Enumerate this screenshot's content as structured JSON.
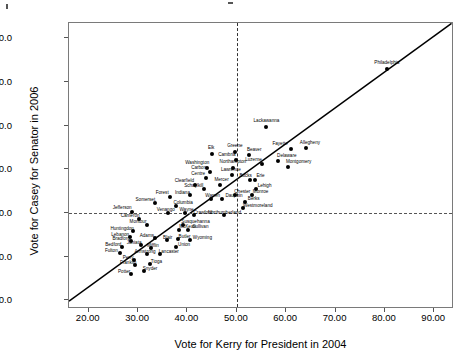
{
  "chart_data": {
    "type": "scatter",
    "title": "",
    "xlabel": "Vote for Kerry for President in 2004",
    "ylabel": "Vote for Casey for Senator in 2006",
    "xlim": [
      16.0,
      94.0
    ],
    "ylim": [
      28.0,
      93.5
    ],
    "xticks": [
      "20.00",
      "30.00",
      "40.00",
      "50.00",
      "60.00",
      "70.00",
      "80.00",
      "90.00"
    ],
    "xtick_values": [
      20,
      30,
      40,
      50,
      60,
      70,
      80,
      90
    ],
    "yticks": [
      "90.0",
      "80.0",
      "70.0",
      "60.0",
      "50.0",
      "40.0",
      "30.0"
    ],
    "ytick_values": [
      90,
      80,
      70,
      60,
      50,
      40,
      30
    ],
    "grid": false,
    "legend": null,
    "reference_lines": [
      {
        "axis": "x",
        "value": 50,
        "style": "dashed"
      },
      {
        "axis": "y",
        "value": 50,
        "style": "dashed"
      }
    ],
    "fit_line": {
      "style": "solid",
      "x0": 16.0,
      "y0": 29.8,
      "x1": 93.5,
      "y1": 93.4
    },
    "points": [
      {
        "label": "Philadelphia",
        "x": 80.4,
        "y": 83.0,
        "lx": 0,
        "ly": -6
      },
      {
        "label": "Lackawanna",
        "x": 56.0,
        "y": 69.7,
        "lx": 0,
        "ly": -6
      },
      {
        "label": "Fayette",
        "x": 61.0,
        "y": 64.7,
        "lx": -11,
        "ly": -5
      },
      {
        "label": "Allegheny",
        "x": 64.0,
        "y": 64.9,
        "lx": 4,
        "ly": -5
      },
      {
        "label": "Greene",
        "x": 49.6,
        "y": 63.9,
        "lx": 0,
        "ly": -6
      },
      {
        "label": "Elk",
        "x": 45.0,
        "y": 63.4,
        "lx": -1,
        "ly": -6
      },
      {
        "label": "Beaver",
        "x": 52.5,
        "y": 63.2,
        "lx": 5,
        "ly": -5
      },
      {
        "label": "Cambria",
        "x": 49.8,
        "y": 62.1,
        "lx": -9,
        "ly": -5
      },
      {
        "label": "Delaware",
        "x": 58.3,
        "y": 62.0,
        "lx": 9,
        "ly": -5
      },
      {
        "label": "Luzerne",
        "x": 55.0,
        "y": 61.3,
        "lx": -8,
        "ly": -4
      },
      {
        "label": "Montgomery",
        "x": 60.3,
        "y": 60.5,
        "lx": 11,
        "ly": -5
      },
      {
        "label": "Northampton",
        "x": 49.2,
        "y": 60.3,
        "lx": 0,
        "ly": -6
      },
      {
        "label": "Washington",
        "x": 44.0,
        "y": 60.4,
        "lx": -10,
        "ly": -5
      },
      {
        "label": "Carbon",
        "x": 44.5,
        "y": 59.3,
        "lx": -11,
        "ly": -4
      },
      {
        "label": "Lawrence",
        "x": 49.0,
        "y": 58.8,
        "lx": -1,
        "ly": -5
      },
      {
        "label": "Erie",
        "x": 53.6,
        "y": 57.6,
        "lx": 6,
        "ly": -4
      },
      {
        "label": "Bucks",
        "x": 52.6,
        "y": 57.6,
        "lx": -4,
        "ly": -4
      },
      {
        "label": "Centre",
        "x": 43.8,
        "y": 57.9,
        "lx": -8,
        "ly": -4
      },
      {
        "label": "Clearfield",
        "x": 41.6,
        "y": 56.5,
        "lx": -11,
        "ly": -4
      },
      {
        "label": "Mercer",
        "x": 46.5,
        "y": 56.3,
        "lx": 2,
        "ly": -5
      },
      {
        "label": "Schuylkill",
        "x": 43.3,
        "y": 55.4,
        "lx": -10,
        "ly": -3
      },
      {
        "label": "Lehigh",
        "x": 53.8,
        "y": 55.4,
        "lx": 9,
        "ly": -3
      },
      {
        "label": "Chester",
        "x": 49.7,
        "y": 54.0,
        "lx": 7,
        "ly": -3
      },
      {
        "label": "Monroe",
        "x": 53.0,
        "y": 54.0,
        "lx": 9,
        "ly": -3
      },
      {
        "label": "Indiana",
        "x": 40.6,
        "y": 54.2,
        "lx": -8,
        "ly": -2
      },
      {
        "label": "Warren",
        "x": 44.7,
        "y": 53.2,
        "lx": 2,
        "ly": -3
      },
      {
        "label": "Dauphin",
        "x": 47.0,
        "y": 53.2,
        "lx": 12,
        "ly": -3
      },
      {
        "label": "Berks",
        "x": 51.6,
        "y": 52.6,
        "lx": 9,
        "ly": -3
      },
      {
        "label": "Forest",
        "x": 36.5,
        "y": 53.6,
        "lx": -8,
        "ly": -4
      },
      {
        "label": "Somerset",
        "x": 33.5,
        "y": 52.3,
        "lx": -10,
        "ly": -3
      },
      {
        "label": "Columbia",
        "x": 37.7,
        "y": 51.6,
        "lx": 7,
        "ly": -3
      },
      {
        "label": "Westmoreland",
        "x": 51.2,
        "y": 51.1,
        "lx": 15,
        "ly": -2
      },
      {
        "label": "Jefferson",
        "x": 28.8,
        "y": 50.2,
        "lx": -10,
        "ly": -4
      },
      {
        "label": "Venango",
        "x": 36.0,
        "y": 50.0,
        "lx": -2,
        "ly": -3
      },
      {
        "label": "Wayne",
        "x": 39.6,
        "y": 50.1,
        "lx": 1,
        "ly": -3
      },
      {
        "label": "Northumberland",
        "x": 47.5,
        "y": 49.6,
        "lx": 0,
        "ly": -2
      },
      {
        "label": "Crawford",
        "x": 41.3,
        "y": 49.5,
        "lx": 9,
        "ly": -2
      },
      {
        "label": "Cameron",
        "x": 30.2,
        "y": 48.6,
        "lx": -9,
        "ly": -3
      },
      {
        "label": "Susquehanna",
        "x": 39.0,
        "y": 47.3,
        "lx": 13,
        "ly": -3
      },
      {
        "label": "Montour",
        "x": 31.8,
        "y": 47.2,
        "lx": -9,
        "ly": -3
      },
      {
        "label": "McKean",
        "x": 38.2,
        "y": 46.2,
        "lx": 9,
        "ly": -3
      },
      {
        "label": "Sullivan",
        "x": 40.2,
        "y": 46.2,
        "lx": 12,
        "ly": -3
      },
      {
        "label": "Huntingdon",
        "x": 29.0,
        "y": 45.9,
        "lx": -11,
        "ly": -2
      },
      {
        "label": "Lebanon",
        "x": 28.4,
        "y": 44.6,
        "lx": -10,
        "ly": -2
      },
      {
        "label": "Adams",
        "x": 33.4,
        "y": 44.3,
        "lx": -8,
        "ly": -2
      },
      {
        "label": "Blair",
        "x": 35.8,
        "y": 43.9,
        "lx": 1,
        "ly": -2
      },
      {
        "label": "Butler",
        "x": 38.0,
        "y": 44.0,
        "lx": 7,
        "ly": -2
      },
      {
        "label": "Wyoming",
        "x": 40.6,
        "y": 43.9,
        "lx": 12,
        "ly": -2
      },
      {
        "label": "Bradford",
        "x": 28.6,
        "y": 43.5,
        "lx": -10,
        "ly": -2
      },
      {
        "label": "Juniata",
        "x": 30.6,
        "y": 42.6,
        "lx": -7,
        "ly": -2
      },
      {
        "label": "Bedford",
        "x": 26.8,
        "y": 42.1,
        "lx": -9,
        "ly": -2
      },
      {
        "label": "Mifflin",
        "x": 32.6,
        "y": 42.0,
        "lx": 2,
        "ly": -2
      },
      {
        "label": "Union",
        "x": 37.7,
        "y": 42.1,
        "lx": 8,
        "ly": -2
      },
      {
        "label": "Fulton",
        "x": 26.4,
        "y": 40.8,
        "lx": -9,
        "ly": -2
      },
      {
        "label": "Armstrong",
        "x": 31.8,
        "y": 40.6,
        "lx": -2,
        "ly": -2
      },
      {
        "label": "Lancaster",
        "x": 34.4,
        "y": 40.6,
        "lx": 9,
        "ly": -2
      },
      {
        "label": "Perry",
        "x": 29.2,
        "y": 39.3,
        "lx": -6,
        "ly": -2
      },
      {
        "label": "Franklin",
        "x": 29.4,
        "y": 38.1,
        "lx": -7,
        "ly": -2
      },
      {
        "label": "Tioga",
        "x": 32.5,
        "y": 38.2,
        "lx": 6,
        "ly": -2
      },
      {
        "label": "Snyder",
        "x": 31.2,
        "y": 36.6,
        "lx": 6,
        "ly": -2
      },
      {
        "label": "Potter",
        "x": 28.6,
        "y": 36.0,
        "lx": -7,
        "ly": -2
      }
    ]
  }
}
